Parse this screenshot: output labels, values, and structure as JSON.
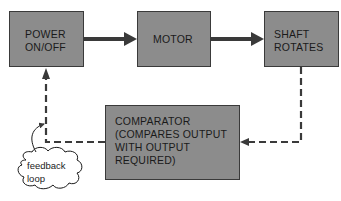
{
  "diagram": {
    "nodes": [
      {
        "id": "power",
        "label": "POWER\nON/OFF"
      },
      {
        "id": "motor",
        "label": "MOTOR"
      },
      {
        "id": "shaft",
        "label": "SHAFT\nROTATES"
      },
      {
        "id": "comparator",
        "label": "COMPARATOR\n(COMPARES OUTPUT\nWITH OUTPUT\nREQUIRED)"
      }
    ],
    "edges": [
      {
        "from": "power",
        "to": "motor",
        "style": "solid"
      },
      {
        "from": "motor",
        "to": "shaft",
        "style": "solid"
      },
      {
        "from": "shaft",
        "to": "comparator",
        "style": "dashed"
      },
      {
        "from": "comparator",
        "to": "power",
        "style": "dashed"
      }
    ],
    "annotation": {
      "label": "feedback\nloop",
      "shape": "cloud",
      "points_to": "comparator-to-power edge"
    },
    "colors": {
      "box_fill": "#8c8c8c",
      "box_border": "#3a3a3a",
      "line": "#3a3a3a"
    }
  }
}
